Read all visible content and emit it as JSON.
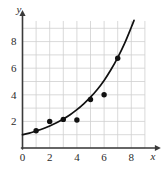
{
  "chart_data": {
    "type": "scatter",
    "title": "",
    "subtitle": "",
    "xlabel": "x",
    "ylabel": "y",
    "xlim": [
      0,
      9.4
    ],
    "ylim": [
      0,
      9.6
    ],
    "grid": true,
    "grid_spacing": 1,
    "grid_color": "#cfcfcf",
    "axis_color": "#3a3a3a",
    "legend": "none",
    "xticks": [
      0,
      2,
      4,
      6,
      8
    ],
    "xtick_labels": [
      "0",
      "2",
      "4",
      "6",
      "8"
    ],
    "yticks": [
      2,
      4,
      6,
      8
    ],
    "ytick_labels": [
      "2",
      "4",
      "6",
      "8"
    ],
    "series": [
      {
        "name": "data-points",
        "type": "scatter",
        "marker": "filled-circle",
        "color": "#111111",
        "points": [
          {
            "x": 1,
            "y": 1.3
          },
          {
            "x": 2,
            "y": 2.0
          },
          {
            "x": 3,
            "y": 2.15
          },
          {
            "x": 4,
            "y": 2.1
          },
          {
            "x": 5,
            "y": 3.65
          },
          {
            "x": 6,
            "y": 4.0
          },
          {
            "x": 7,
            "y": 6.75
          }
        ]
      },
      {
        "name": "fitted-curve",
        "type": "line",
        "color": "#111111",
        "description": "exponential growth curve",
        "points": [
          {
            "x": 0.0,
            "y": 1.0
          },
          {
            "x": 0.5,
            "y": 1.12
          },
          {
            "x": 1.0,
            "y": 1.28
          },
          {
            "x": 1.5,
            "y": 1.45
          },
          {
            "x": 2.0,
            "y": 1.66
          },
          {
            "x": 2.5,
            "y": 1.9
          },
          {
            "x": 3.0,
            "y": 2.18
          },
          {
            "x": 3.5,
            "y": 2.5
          },
          {
            "x": 4.0,
            "y": 2.88
          },
          {
            "x": 4.5,
            "y": 3.32
          },
          {
            "x": 5.0,
            "y": 3.82
          },
          {
            "x": 5.5,
            "y": 4.4
          },
          {
            "x": 6.0,
            "y": 5.08
          },
          {
            "x": 6.5,
            "y": 5.88
          },
          {
            "x": 7.0,
            "y": 6.8
          },
          {
            "x": 7.5,
            "y": 7.85
          },
          {
            "x": 8.0,
            "y": 9.08
          },
          {
            "x": 8.2,
            "y": 9.6
          }
        ]
      }
    ]
  }
}
